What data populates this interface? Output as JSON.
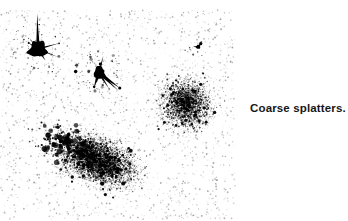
{
  "image": {
    "width": 348,
    "height": 221,
    "background_color": "#ffffff",
    "ink_color": "#000000",
    "subject": "ink-splatter-specimen"
  },
  "caption": {
    "text": "Coarse splatters.",
    "color": "#171717",
    "x": 250,
    "y": 103,
    "font_size": 11.5,
    "font_weight": "bold"
  },
  "splatters": [
    {
      "name": "blot-upper-left",
      "kind": "solid-blot",
      "cx": 38,
      "cy": 49,
      "rx": 11,
      "ry": 8,
      "spike_count": 7,
      "speck_count": 90,
      "speck_spread": 26,
      "seed": 101
    },
    {
      "name": "blot-upper-middle",
      "kind": "solid-blot",
      "cx": 99,
      "cy": 73,
      "rx": 7,
      "ry": 7,
      "spike_count": 6,
      "speck_count": 110,
      "speck_spread": 22,
      "seed": 202
    },
    {
      "name": "spray-cloud-right",
      "kind": "stipple-cloud",
      "cx": 186,
      "cy": 103,
      "rx": 30,
      "ry": 31,
      "rotation": -25,
      "dot_count": 5200,
      "core_density": 0.92,
      "max_dot_size": 1.9,
      "seed": 303
    },
    {
      "name": "spray-cloud-bottom",
      "kind": "stipple-cloud",
      "cx": 97,
      "cy": 160,
      "rx": 50,
      "ry": 27,
      "rotation": 22,
      "dot_count": 9800,
      "core_density": 1.0,
      "max_dot_size": 2.1,
      "seed": 404
    },
    {
      "name": "coarse-droplets-left-flank",
      "kind": "coarse-droplets",
      "cx": 62,
      "cy": 142,
      "rx": 28,
      "ry": 17,
      "rotation": 18,
      "dot_count": 190,
      "max_dot_size": 3.0,
      "seed": 505
    },
    {
      "name": "stray-speck-upper-right",
      "kind": "solid-blot",
      "cx": 198,
      "cy": 47,
      "rx": 1.9,
      "ry": 2.4,
      "spike_count": 2,
      "speck_count": 18,
      "speck_spread": 12,
      "seed": 606
    },
    {
      "name": "background-mist",
      "kind": "mist",
      "cx": 120,
      "cy": 115,
      "rx": 125,
      "ry": 105,
      "dot_count": 2600,
      "max_dot_size": 1.0,
      "seed": 707
    }
  ]
}
